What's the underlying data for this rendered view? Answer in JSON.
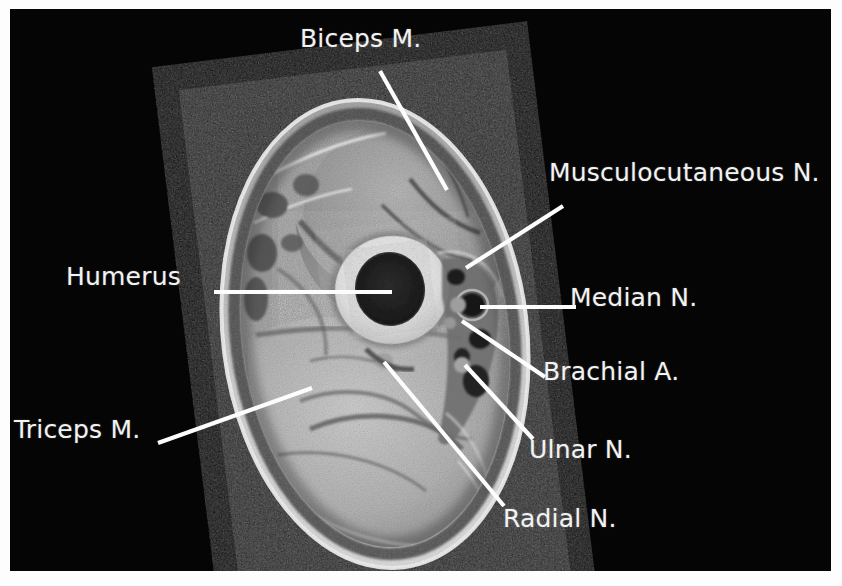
{
  "figure": {
    "modality": "MRI",
    "view": "axial cross-section of the upper arm (mid-humeral level)",
    "background_color": "#050505",
    "label_color": "#f2f2f2",
    "leader_color": "#fdfdfd"
  },
  "annotations": [
    {
      "id": "biceps",
      "label": "Biceps M.",
      "text_x": 300,
      "text_y": 26,
      "leader": "M 370 62 L 437 181",
      "region": "upper anterior compartment muscle"
    },
    {
      "id": "musculocutaneous",
      "label": "Musculocutaneous N.",
      "text_x": 549,
      "text_y": 160,
      "leader": "M 553 197 L 456 259",
      "region": "nerve between biceps and brachialis"
    },
    {
      "id": "humerus",
      "label": "Humerus",
      "text_x": 66,
      "text_y": 264,
      "leader": "M 204 283 L 382 283",
      "region": "central cortical bone ring with marrow"
    },
    {
      "id": "median",
      "label": "Median N.",
      "text_x": 570,
      "text_y": 285,
      "leader": "M 566 298 L 470 298",
      "region": "medial neurovascular bundle"
    },
    {
      "id": "brachial-artery",
      "label": "Brachial A.",
      "text_x": 543,
      "text_y": 359,
      "leader": "M 535 368 L 452 312",
      "region": "artery in medial neurovascular bundle"
    },
    {
      "id": "ulnar",
      "label": "Ulnar N.",
      "text_x": 529,
      "text_y": 437,
      "leader": "M 523 430 L 455 356",
      "region": "nerve posteromedial to the bundle"
    },
    {
      "id": "radial",
      "label": "Radial N.",
      "text_x": 503,
      "text_y": 506,
      "leader": "M 494 497 L 374 353",
      "region": "nerve in the spiral groove, posterior to humerus"
    },
    {
      "id": "triceps",
      "label": "Triceps M.",
      "text_x": 14,
      "text_y": 417,
      "leader": "M 148 434 L 302 379",
      "region": "large posterior compartment muscle"
    }
  ]
}
